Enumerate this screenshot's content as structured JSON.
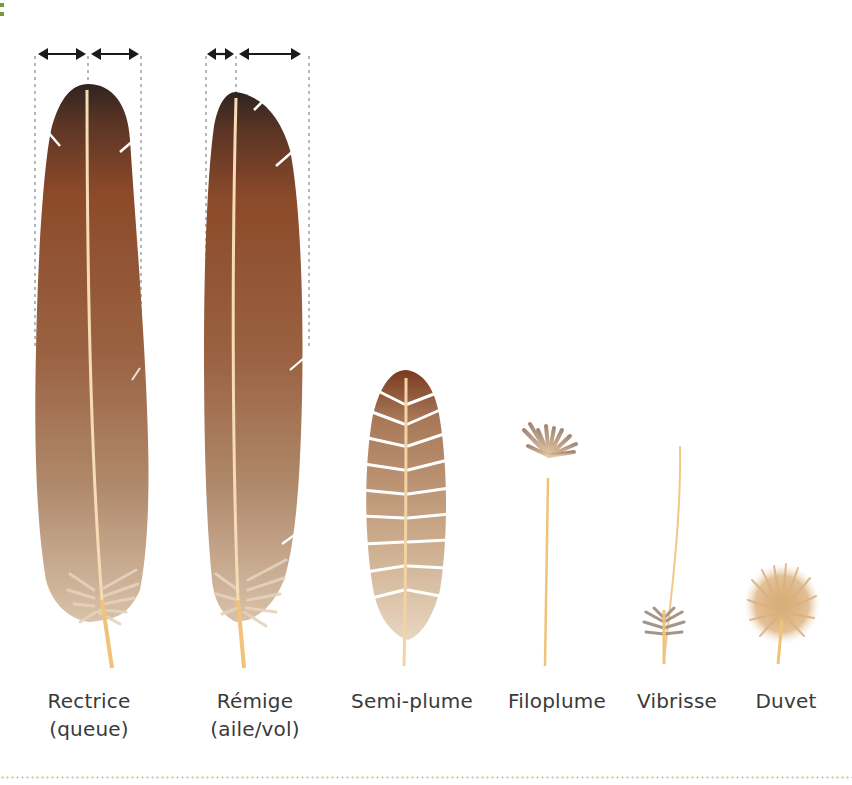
{
  "figure": {
    "colors": {
      "feather_dark": "#3a2620",
      "feather_mid": "#8a4a2a",
      "feather_light": "#b99579",
      "rachis": "#f3d7b0",
      "quill": "#f0c27a",
      "measure_lines": "#9aa0a8",
      "arrows": "#1a1a1a",
      "label_text": "#3a3a3a",
      "divider": "#cfdaa8",
      "corner_marks": "#7a9a3a"
    },
    "feathers": [
      {
        "id": "rectrice",
        "label_line1": "Rectrice",
        "label_line2": "(queue)",
        "symmetry": "symmetric vanes"
      },
      {
        "id": "remige",
        "label_line1": "Rémige",
        "label_line2": "(aile/vol)",
        "symmetry": "asymmetric vanes"
      },
      {
        "id": "semi-plume",
        "label_line1": "Semi-plume",
        "label_line2": ""
      },
      {
        "id": "filoplume",
        "label_line1": "Filoplume",
        "label_line2": ""
      },
      {
        "id": "vibrisse",
        "label_line1": "Vibrisse",
        "label_line2": ""
      },
      {
        "id": "duvet",
        "label_line1": "Duvet",
        "label_line2": ""
      }
    ]
  }
}
